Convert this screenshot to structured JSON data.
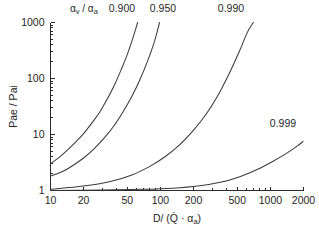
{
  "chart_data": {
    "type": "line",
    "title": "",
    "xlabel": "D/ (Q̇ · αₐ)",
    "ylabel": "Pae / Pai",
    "xscale": "log",
    "yscale": "log",
    "xlim": [
      10,
      2000
    ],
    "ylim": [
      1,
      1000
    ],
    "grid": false,
    "legend_position": "in-plot-curve-labels",
    "legend_title": "αᵥ / αₐ",
    "xticks": [
      10,
      20,
      50,
      100,
      200,
      500,
      1000,
      2000
    ],
    "xtick_labels": [
      "10",
      "20",
      "50",
      "100",
      "200",
      "500",
      "1000",
      "2000"
    ],
    "yticks": [
      1,
      10,
      100,
      1000
    ],
    "ytick_labels": [
      "1",
      "10",
      "100",
      "1000"
    ],
    "series": [
      {
        "name": "0.900",
        "label": "0.900",
        "x": [
          10,
          12,
          14,
          17,
          20,
          24,
          28,
          33,
          38,
          44,
          50,
          56,
          62
        ],
        "y": [
          3.0,
          3.9,
          5.1,
          7.4,
          10.4,
          16.5,
          25.0,
          44.0,
          75.0,
          145.0,
          270.0,
          520.0,
          1000.0
        ]
      },
      {
        "name": "0.950",
        "label": "0.950",
        "x": [
          10,
          13,
          16,
          20,
          25,
          31,
          38,
          46,
          55,
          65,
          76,
          88,
          98
        ],
        "y": [
          1.8,
          2.2,
          2.8,
          3.8,
          5.6,
          8.8,
          14.5,
          26.0,
          48.0,
          95.0,
          200.0,
          450.0,
          1000.0
        ]
      },
      {
        "name": "0.990",
        "label": "0.990",
        "x": [
          10,
          20,
          35,
          55,
          80,
          110,
          150,
          200,
          260,
          330,
          420,
          520,
          620,
          700
        ],
        "y": [
          1.05,
          1.2,
          1.45,
          1.9,
          2.7,
          4.0,
          6.6,
          12.0,
          23.0,
          48.0,
          120.0,
          300.0,
          680.0,
          1000.0
        ]
      },
      {
        "name": "0.999",
        "label": "0.999",
        "x": [
          10,
          30,
          70,
          130,
          220,
          350,
          520,
          750,
          1050,
          1400,
          1750,
          2000
        ],
        "y": [
          1.0,
          1.02,
          1.05,
          1.1,
          1.2,
          1.4,
          1.75,
          2.35,
          3.3,
          4.6,
          6.2,
          7.6
        ]
      }
    ],
    "curve_label_positions": [
      {
        "label": "0.900",
        "x_px": 122,
        "y_px": 12
      },
      {
        "label": "0.950",
        "x_px": 163,
        "y_px": 12
      },
      {
        "label": "0.990",
        "x_px": 231,
        "y_px": 12
      },
      {
        "label": "0.999",
        "x_px": 283,
        "y_px": 127
      }
    ]
  }
}
